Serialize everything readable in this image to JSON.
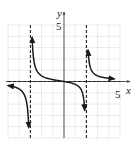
{
  "chart_data": {
    "type": "line",
    "title": "",
    "function": "f(x) = x / ((x + 3)(x - 2))",
    "xlabel": "x",
    "ylabel": "y",
    "xlim": [
      -5,
      5
    ],
    "ylim": [
      -5,
      5
    ],
    "grid": true,
    "grid_step": 1,
    "tick_labels": {
      "x": [
        "5"
      ],
      "y": [
        "5"
      ]
    },
    "asymptotes": {
      "vertical": [
        -3,
        2
      ],
      "horizontal": [
        0
      ]
    },
    "series": [
      {
        "name": "left-branch",
        "x": [
          -5,
          -4.5,
          -4,
          -3.6,
          -3.4,
          -3.25,
          -3.15
        ],
        "y": [
          -0.357,
          -0.462,
          -0.667,
          -1.071,
          -1.574,
          -2.475,
          -4.0
        ]
      },
      {
        "name": "middle-branch",
        "x": [
          -2.85,
          -2.7,
          -2.5,
          -2,
          -1,
          0,
          1,
          1.5,
          1.75,
          1.85
        ],
        "y": [
          4.0,
          1.918,
          1.111,
          0.5,
          0.167,
          0,
          -0.25,
          -0.667,
          -1.474,
          -3.0
        ]
      },
      {
        "name": "right-branch",
        "x": [
          2.15,
          2.3,
          2.5,
          3,
          3.5,
          4,
          4.5
        ],
        "y": [
          2.78,
          1.45,
          0.909,
          0.5,
          0.359,
          0.286,
          0.24
        ]
      }
    ],
    "colors": {
      "curve": "#1a1a1a",
      "grid": "#b8b8b8",
      "axis": "#555555",
      "asymptote": "#222222"
    }
  }
}
